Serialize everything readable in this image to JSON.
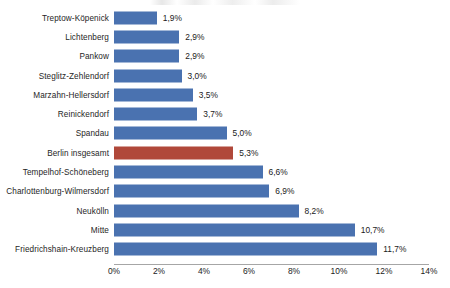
{
  "chart_data": {
    "type": "bar",
    "orientation": "horizontal",
    "title": "",
    "subtitle": "",
    "xlabel": "",
    "ylabel": "",
    "xlim": [
      0,
      14
    ],
    "grid": false,
    "legend": null,
    "value_suffix": "%",
    "decimal_separator": ",",
    "categories": [
      "Treptow-Köpenick",
      "Lichtenberg",
      "Pankow",
      "Steglitz-Zehlendorf",
      "Marzahn-Hellersdorf",
      "Reinickendorf",
      "Spandau",
      "Berlin insgesamt",
      "Tempelhof-Schöneberg",
      "Charlottenburg-Wilmersdorf",
      "Neukölln",
      "Mitte",
      "Friedrichshain-Kreuzberg"
    ],
    "values": [
      1.9,
      2.9,
      2.9,
      3.0,
      3.5,
      3.7,
      5.0,
      5.3,
      6.6,
      6.9,
      8.2,
      10.7,
      11.7
    ],
    "value_labels": [
      "1,9%",
      "2,9%",
      "2,9%",
      "3,0%",
      "3,5%",
      "3,7%",
      "5,0%",
      "5,3%",
      "6,6%",
      "6,9%",
      "8,2%",
      "10,7%",
      "11,7%"
    ],
    "highlight_index": 7,
    "colors": {
      "bar": "#4a72b0",
      "highlight_bar": "#b0483a",
      "axis": "#a6a6a6",
      "text": "#1a1a1a",
      "background": "#ffffff"
    },
    "x_ticks": [
      0,
      2,
      4,
      6,
      8,
      10,
      12,
      14
    ],
    "x_tick_labels": [
      "0%",
      "2%",
      "4%",
      "6%",
      "8%",
      "10%",
      "12%",
      "14%"
    ]
  }
}
